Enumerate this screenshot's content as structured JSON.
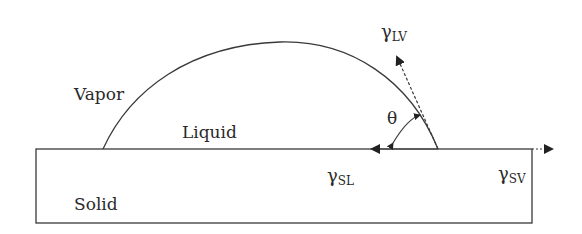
{
  "diagram": {
    "type": "contact-angle-schematic",
    "regions": {
      "vapor": "Vapor",
      "liquid": "Liquid",
      "solid": "Solid"
    },
    "angle": "θ",
    "tensions": {
      "lv": {
        "symbol": "γ",
        "sub": "LV"
      },
      "sl": {
        "symbol": "γ",
        "sub": "SL"
      },
      "sv": {
        "symbol": "γ",
        "sub": "SV"
      }
    },
    "colors": {
      "stroke": "#3a3a3a",
      "text": "#2a2a2a",
      "background": "#ffffff"
    }
  }
}
